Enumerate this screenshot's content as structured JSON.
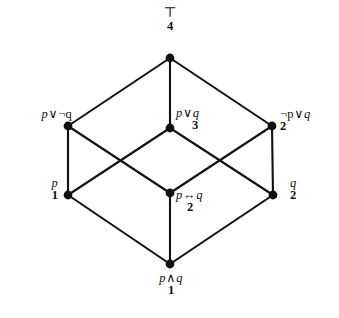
{
  "figure": {
    "type": "hasse-diagram",
    "background_color": "#ffffff",
    "ink_color": "#111111",
    "width": 339,
    "height": 318
  },
  "nodes": [
    {
      "id": "top",
      "formula": "⊤",
      "rank": "4",
      "x": 170,
      "y": 58,
      "label_position": "above"
    },
    {
      "id": "p_or_not_q",
      "formula_parts": {
        "left": "p",
        "op": "∨",
        "right": "¬q"
      },
      "formula": "p ∨ ¬q",
      "rank": "3",
      "x": 68,
      "y": 126,
      "label_position": "left"
    },
    {
      "id": "p_or_q",
      "formula_parts": {
        "left": "p",
        "op": "∨",
        "right": "q"
      },
      "formula": "p ∨ q",
      "rank": "3",
      "x": 170,
      "y": 128,
      "label_position": "right"
    },
    {
      "id": "not_p_or_q",
      "formula_parts": {
        "left": "¬p",
        "op": "∨",
        "right": "q"
      },
      "formula": "¬p ∨ q",
      "rank": "2",
      "x": 272,
      "y": 126,
      "label_position": "right"
    },
    {
      "id": "p",
      "formula": "p",
      "rank": "1",
      "x": 68,
      "y": 195,
      "label_position": "left"
    },
    {
      "id": "p_iff_q",
      "formula_parts": {
        "left": "p",
        "op": "↔",
        "right": "q"
      },
      "formula": "p ↔ q",
      "rank": "2",
      "x": 170,
      "y": 193,
      "label_position": "right"
    },
    {
      "id": "q",
      "formula": "q",
      "rank": "2",
      "x": 273,
      "y": 195,
      "label_position": "right"
    },
    {
      "id": "p_and_q",
      "formula_parts": {
        "left": "p",
        "op": "∧",
        "right": "q"
      },
      "formula": "p ∧ q",
      "rank": "1",
      "x": 170,
      "y": 264,
      "label_position": "below"
    }
  ],
  "edges": [
    {
      "from": "top",
      "to": "p_or_not_q"
    },
    {
      "from": "top",
      "to": "p_or_q"
    },
    {
      "from": "top",
      "to": "not_p_or_q"
    },
    {
      "from": "p_or_not_q",
      "to": "p"
    },
    {
      "from": "p_or_not_q",
      "to": "p_iff_q"
    },
    {
      "from": "p_or_q",
      "to": "p"
    },
    {
      "from": "p_or_q",
      "to": "q"
    },
    {
      "from": "not_p_or_q",
      "to": "q"
    },
    {
      "from": "not_p_or_q",
      "to": "p_iff_q"
    },
    {
      "from": "p",
      "to": "p_and_q"
    },
    {
      "from": "p_iff_q",
      "to": "p_and_q"
    },
    {
      "from": "q",
      "to": "p_and_q"
    }
  ],
  "style": {
    "node_radius": 4.4,
    "edge_width": 2.1
  }
}
